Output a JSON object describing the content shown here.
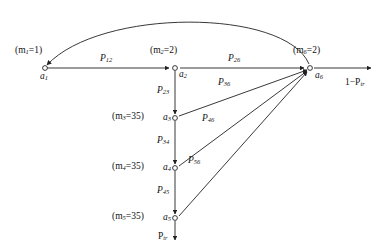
{
  "figure": {
    "type": "state-transition-diagram",
    "background_color": "#ffffff",
    "stroke_color": "#222222",
    "nodes": [
      {
        "id": "a1",
        "label": "a",
        "sub": "1",
        "mass_text": "(m",
        "mass_sub": "1",
        "mass_tail": "=1)",
        "x": 45,
        "y": 68
      },
      {
        "id": "a2",
        "label": "a",
        "sub": "2",
        "mass_text": "(m",
        "mass_sub": "2",
        "mass_tail": "=2)",
        "x": 175,
        "y": 68
      },
      {
        "id": "a3",
        "label": "a",
        "sub": "3",
        "mass_text": "(m",
        "mass_sub": "3",
        "mass_tail": "=35)",
        "x": 175,
        "y": 118
      },
      {
        "id": "a4",
        "label": "a",
        "sub": "4",
        "mass_text": "(m",
        "mass_sub": "4",
        "mass_tail": "=35)",
        "x": 175,
        "y": 168
      },
      {
        "id": "a5",
        "label": "a",
        "sub": "5",
        "mass_text": "(m",
        "mass_sub": "5",
        "mass_tail": "=35)",
        "x": 175,
        "y": 218
      },
      {
        "id": "a6",
        "label": "a",
        "sub": "6",
        "mass_text": "(m",
        "mass_sub": "6",
        "mass_tail": "=2)",
        "x": 310,
        "y": 68
      }
    ],
    "edges": [
      {
        "id": "e12",
        "from": "a1",
        "to": "a2",
        "label_p": "P",
        "label_sub": "12"
      },
      {
        "id": "e26",
        "from": "a2",
        "to": "a6",
        "label_p": "P",
        "label_sub": "26"
      },
      {
        "id": "e23",
        "from": "a2",
        "to": "a3",
        "label_p": "P",
        "label_sub": "23"
      },
      {
        "id": "e34",
        "from": "a3",
        "to": "a4",
        "label_p": "P",
        "label_sub": "34"
      },
      {
        "id": "e45",
        "from": "a4",
        "to": "a5",
        "label_p": "P",
        "label_sub": "45"
      },
      {
        "id": "e36",
        "from": "a3",
        "to": "a6",
        "label_p": "P",
        "label_sub": "36"
      },
      {
        "id": "e46",
        "from": "a4",
        "to": "a6",
        "label_p": "P",
        "label_sub": "46"
      },
      {
        "id": "e56",
        "from": "a5",
        "to": "a6",
        "label_p": "P",
        "label_sub": "56"
      },
      {
        "id": "e61",
        "from": "a6",
        "to": "a1",
        "label_p": "",
        "label_sub": ""
      }
    ],
    "flows": [
      {
        "id": "out-right",
        "text": "1−P",
        "sub": "tr",
        "x": 345,
        "y": 80
      },
      {
        "id": "out-bottom",
        "text": "P",
        "sub": "tr",
        "x": 157,
        "y": 234
      }
    ]
  }
}
